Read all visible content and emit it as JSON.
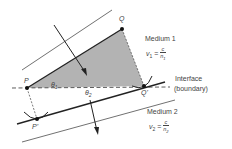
{
  "points": {
    "P": "P",
    "Q": "Q",
    "Q_prime": "Q'",
    "P_prime": "P'"
  },
  "angles": {
    "theta1": "θ",
    "theta1_sub": "1",
    "theta2": "θ",
    "theta2_sub": "2"
  },
  "medium1": {
    "title": "Medium 1",
    "v": "v",
    "v_sub": "1",
    "eq": " = ",
    "num": "c",
    "den": "n",
    "den_sub": "1"
  },
  "medium2": {
    "title": "Medium 2",
    "v": "v",
    "v_sub": "2",
    "eq": " = ",
    "num": "c",
    "den": "n",
    "den_sub": "2"
  },
  "interface": {
    "line1": "Interface",
    "line2": "(boundary)"
  },
  "colors": {
    "shade": "#b3b3b3",
    "ink": "#222222"
  }
}
